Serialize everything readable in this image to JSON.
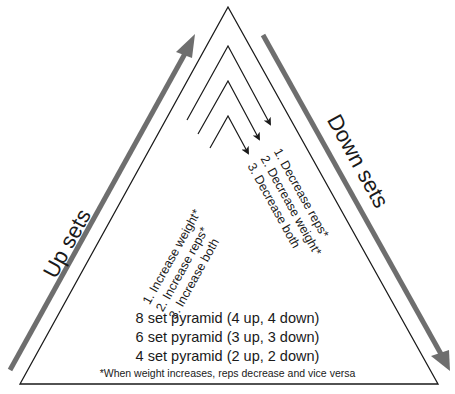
{
  "diagram": {
    "type": "pyramid-training",
    "up_label": "Up sets",
    "down_label": "Down sets",
    "up_list": [
      "1. Increase weight*",
      "2. Increase reps*",
      "3. Increase both"
    ],
    "down_list": [
      "1. Decrease reps*",
      "2. Decrease weight*",
      "3. Decrease both"
    ],
    "pyramids": [
      "8 set pyramid (4 up, 4 down)",
      "6 set pyramid (3 up, 3 down)",
      "4 set pyramid (2 up, 2 down)"
    ],
    "footnote": "*When weight increases, reps decrease and vice versa",
    "colors": {
      "arrow_gray": "#6e6e6e",
      "line": "#1a1a1a",
      "background": "#ffffff"
    }
  }
}
